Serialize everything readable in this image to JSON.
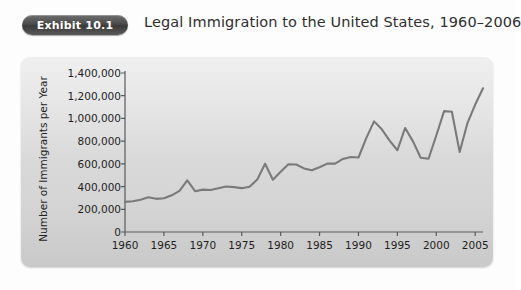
{
  "header": {
    "badge_label": "Exhibit 10.1",
    "title": "Legal Immigration to the United States, 1960–2006"
  },
  "colors": {
    "badge_dark": "#4b4b4b",
    "panel_gray": "#d8d8d8",
    "line_gray": "#7a7a7a",
    "axis_gray": "#5a5a5a",
    "text_dark": "#1e1e1e"
  },
  "chart_data": {
    "type": "line",
    "title": "Legal Immigration to the United States, 1960–2006",
    "xlabel": "",
    "ylabel": "Number of Immigrants per Year",
    "xlim": [
      1960,
      2006
    ],
    "ylim": [
      0,
      1400000
    ],
    "grid": false,
    "legend": "none",
    "line_color": "#7a7a7a",
    "ytick_labels": [
      "0",
      "200,000",
      "400,000",
      "600,000",
      "800,000",
      "1,000,000",
      "1,200,000",
      "1,400,000"
    ],
    "ytick_values": [
      0,
      200000,
      400000,
      600000,
      800000,
      1000000,
      1200000,
      1400000
    ],
    "xtick_labels": [
      "1960",
      "1965",
      "1970",
      "1975",
      "1980",
      "1985",
      "1990",
      "1995",
      "2000",
      "2005"
    ],
    "xtick_values": [
      1960,
      1965,
      1970,
      1975,
      1980,
      1985,
      1990,
      1995,
      2000,
      2005
    ],
    "x": [
      1960,
      1961,
      1962,
      1963,
      1964,
      1965,
      1966,
      1967,
      1968,
      1969,
      1970,
      1971,
      1972,
      1973,
      1974,
      1975,
      1976,
      1977,
      1978,
      1979,
      1980,
      1981,
      1982,
      1983,
      1984,
      1985,
      1986,
      1987,
      1988,
      1989,
      1990,
      1991,
      1992,
      1993,
      1994,
      1995,
      1996,
      1997,
      1998,
      1999,
      2000,
      2001,
      2002,
      2003,
      2004,
      2005,
      2006
    ],
    "values": [
      265000,
      271000,
      284000,
      306000,
      292000,
      297000,
      323000,
      362000,
      454000,
      359000,
      373000,
      370000,
      385000,
      400000,
      395000,
      386000,
      399000,
      462000,
      601000,
      460000,
      531000,
      597000,
      594000,
      560000,
      544000,
      570000,
      602000,
      602000,
      643000,
      660000,
      656000,
      827000,
      974000,
      904000,
      804000,
      720000,
      916000,
      798000,
      654000,
      645000,
      850000,
      1064000,
      1059000,
      704000,
      958000,
      1122000,
      1266000
    ],
    "series_name": "Legal immigrants admitted per year"
  }
}
